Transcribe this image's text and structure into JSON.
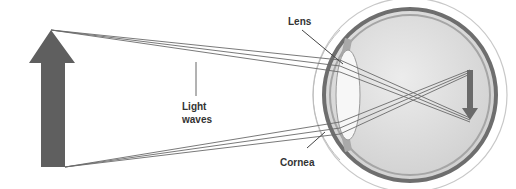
{
  "diagram": {
    "labels": {
      "lens": "Lens",
      "light_waves_line1": "Light",
      "light_waves_line2": "waves",
      "cornea": "Cornea"
    },
    "colors": {
      "arrow": "#5f5f5f",
      "rays": "#6a6a6a",
      "eyeball_fill": "#d9d9d9",
      "sclera_outline": "#6e6e6e",
      "lens_fill": "#f7f7f7"
    }
  }
}
